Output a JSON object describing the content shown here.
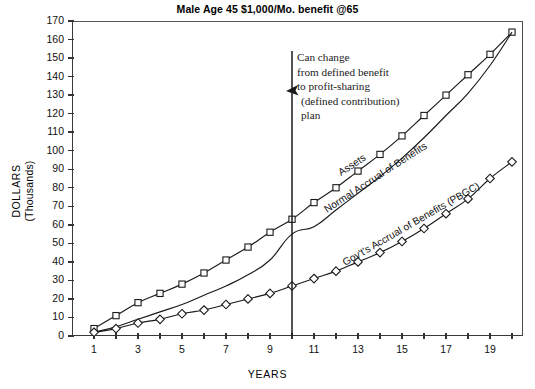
{
  "chart_data": {
    "type": "line",
    "title": "Male Age 45 $1,000/Mo. benefit @65",
    "xlabel": "YEARS",
    "ylabel": "DOLLARS",
    "ylabel_secondary": "(Thousands)",
    "xlim": [
      0,
      20.5
    ],
    "ylim": [
      0,
      170
    ],
    "grid": false,
    "legend_position": "inline-labels",
    "y_ticks": [
      0,
      10,
      20,
      30,
      40,
      50,
      60,
      70,
      80,
      90,
      100,
      110,
      120,
      130,
      140,
      150,
      160,
      170
    ],
    "x_ticks": [
      1,
      2,
      3,
      4,
      5,
      6,
      7,
      8,
      9,
      10,
      11,
      12,
      13,
      14,
      15,
      16,
      17,
      18,
      19,
      20
    ],
    "x_tick_labels_shown": [
      1,
      3,
      5,
      7,
      9,
      11,
      13,
      15,
      17,
      19
    ],
    "x": [
      1,
      2,
      3,
      4,
      5,
      6,
      7,
      8,
      9,
      10,
      11,
      12,
      13,
      14,
      15,
      16,
      17,
      18,
      19,
      20
    ],
    "series": [
      {
        "name": "Assets",
        "marker": "square",
        "values": [
          4,
          11,
          18,
          23,
          28,
          34,
          41,
          48,
          56,
          63,
          72,
          80,
          89,
          98,
          108,
          119,
          130,
          141,
          152,
          164
        ]
      },
      {
        "name": "Normal Accrual of Benefits",
        "marker": "none",
        "values": [
          2,
          5,
          9,
          13,
          17,
          22,
          27,
          33,
          41,
          55,
          59,
          68,
          77,
          86,
          96,
          107,
          119,
          131,
          146,
          164
        ]
      },
      {
        "name": "Gov't's Accrual of Benefits (PBGC)",
        "marker": "diamond",
        "values": [
          2,
          4,
          7,
          9,
          12,
          14,
          17,
          20,
          23,
          27,
          31,
          35,
          40,
          45,
          51,
          58,
          66,
          74,
          85,
          94
        ]
      }
    ],
    "annotation": {
      "lines": [
        "Can change",
        "from defined benefit",
        "to profit-sharing",
        "(defined contribution)",
        "plan"
      ],
      "arrow": "arrow-left-icon",
      "marker_line_at_x": 10
    },
    "colors": {
      "line": "#1a1a1a",
      "axis": "#333333",
      "text": "#000000",
      "background": "#ffffff"
    }
  }
}
